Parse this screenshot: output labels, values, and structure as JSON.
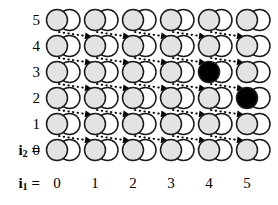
{
  "figure": {
    "title": "",
    "axis_x": {
      "label_prefix": "i",
      "label_sub": "1",
      "label_eq": " =",
      "ticks": [
        "0",
        "1",
        "2",
        "3",
        "4",
        "5"
      ]
    },
    "axis_y": {
      "label_prefix": "i",
      "label_sub": "2",
      "label_eq": " =",
      "ticks": [
        "5",
        "4",
        "3",
        "2",
        "1",
        "0"
      ]
    },
    "colors": {
      "shaded_circle": "#e3e3e3",
      "empty_circle": "#ffffff",
      "filled_circle": "#000000",
      "outline": "#1a1a1a",
      "arrow": "#000000"
    },
    "legend_note": ""
  },
  "chart_data": {
    "type": "scatter",
    "title": "",
    "xlabel": "i1",
    "ylabel": "i2",
    "x": [
      0,
      1,
      2,
      3,
      4,
      5
    ],
    "y": [
      0,
      1,
      2,
      3,
      4,
      5
    ],
    "xlim": [
      0,
      5
    ],
    "ylim": [
      0,
      5
    ],
    "grid": false,
    "legend_position": "none",
    "cell_glyph": "two-overlapping-circles",
    "cells": [
      {
        "i1": 0,
        "i2": 5,
        "left": "shaded",
        "right": "empty",
        "arrow_out": true
      },
      {
        "i1": 1,
        "i2": 5,
        "left": "shaded",
        "right": "empty",
        "arrow_out": true
      },
      {
        "i1": 2,
        "i2": 5,
        "left": "shaded",
        "right": "empty",
        "arrow_out": true
      },
      {
        "i1": 3,
        "i2": 5,
        "left": "shaded",
        "right": "empty",
        "arrow_out": true
      },
      {
        "i1": 4,
        "i2": 5,
        "left": "shaded",
        "right": "empty",
        "arrow_out": true
      },
      {
        "i1": 5,
        "i2": 5,
        "left": "shaded",
        "right": "empty",
        "arrow_out": false
      },
      {
        "i1": 0,
        "i2": 4,
        "left": "shaded",
        "right": "empty",
        "arrow_out": true
      },
      {
        "i1": 1,
        "i2": 4,
        "left": "shaded",
        "right": "empty",
        "arrow_out": true
      },
      {
        "i1": 2,
        "i2": 4,
        "left": "shaded",
        "right": "empty",
        "arrow_out": true
      },
      {
        "i1": 3,
        "i2": 4,
        "left": "shaded",
        "right": "empty",
        "arrow_out": true
      },
      {
        "i1": 4,
        "i2": 4,
        "left": "shaded",
        "right": "empty",
        "arrow_out": true
      },
      {
        "i1": 5,
        "i2": 4,
        "left": "shaded",
        "right": "empty",
        "arrow_out": false
      },
      {
        "i1": 0,
        "i2": 3,
        "left": "shaded",
        "right": "empty",
        "arrow_out": true
      },
      {
        "i1": 1,
        "i2": 3,
        "left": "shaded",
        "right": "empty",
        "arrow_out": true
      },
      {
        "i1": 2,
        "i2": 3,
        "left": "shaded",
        "right": "empty",
        "arrow_out": true
      },
      {
        "i1": 3,
        "i2": 3,
        "left": "shaded",
        "right": "empty",
        "arrow_out": true
      },
      {
        "i1": 4,
        "i2": 3,
        "left": "filled",
        "right": "empty",
        "arrow_out": true
      },
      {
        "i1": 5,
        "i2": 3,
        "left": "shaded",
        "right": "empty",
        "arrow_out": false
      },
      {
        "i1": 0,
        "i2": 2,
        "left": "shaded",
        "right": "empty",
        "arrow_out": true
      },
      {
        "i1": 1,
        "i2": 2,
        "left": "shaded",
        "right": "empty",
        "arrow_out": true
      },
      {
        "i1": 2,
        "i2": 2,
        "left": "shaded",
        "right": "empty",
        "arrow_out": true
      },
      {
        "i1": 3,
        "i2": 2,
        "left": "shaded",
        "right": "empty",
        "arrow_out": true
      },
      {
        "i1": 4,
        "i2": 2,
        "left": "shaded",
        "right": "empty",
        "arrow_out": true
      },
      {
        "i1": 5,
        "i2": 2,
        "left": "filled",
        "right": "empty",
        "arrow_out": false
      },
      {
        "i1": 0,
        "i2": 1,
        "left": "shaded",
        "right": "empty",
        "arrow_out": true
      },
      {
        "i1": 1,
        "i2": 1,
        "left": "shaded",
        "right": "empty",
        "arrow_out": true
      },
      {
        "i1": 2,
        "i2": 1,
        "left": "shaded",
        "right": "empty",
        "arrow_out": true
      },
      {
        "i1": 3,
        "i2": 1,
        "left": "shaded",
        "right": "empty",
        "arrow_out": true
      },
      {
        "i1": 4,
        "i2": 1,
        "left": "shaded",
        "right": "empty",
        "arrow_out": true
      },
      {
        "i1": 5,
        "i2": 1,
        "left": "shaded",
        "right": "empty",
        "arrow_out": false
      },
      {
        "i1": 0,
        "i2": 0,
        "left": "shaded",
        "right": "empty",
        "arrow_out": false
      },
      {
        "i1": 1,
        "i2": 0,
        "left": "shaded",
        "right": "empty",
        "arrow_out": false
      },
      {
        "i1": 2,
        "i2": 0,
        "left": "shaded",
        "right": "empty",
        "arrow_out": false
      },
      {
        "i1": 3,
        "i2": 0,
        "left": "shaded",
        "right": "empty",
        "arrow_out": false
      },
      {
        "i1": 4,
        "i2": 0,
        "left": "shaded",
        "right": "empty",
        "arrow_out": false
      },
      {
        "i1": 5,
        "i2": 0,
        "left": "shaded",
        "right": "empty",
        "arrow_out": false
      }
    ],
    "arrows": [
      {
        "from_i1": 0,
        "from_i2": 5,
        "to_i1": 1,
        "to_i2": 4
      },
      {
        "from_i1": 1,
        "from_i2": 5,
        "to_i1": 2,
        "to_i2": 4
      },
      {
        "from_i1": 2,
        "from_i2": 5,
        "to_i1": 3,
        "to_i2": 4
      },
      {
        "from_i1": 3,
        "from_i2": 5,
        "to_i1": 4,
        "to_i2": 4
      },
      {
        "from_i1": 4,
        "from_i2": 5,
        "to_i1": 5,
        "to_i2": 4
      },
      {
        "from_i1": 0,
        "from_i2": 4,
        "to_i1": 1,
        "to_i2": 3
      },
      {
        "from_i1": 1,
        "from_i2": 4,
        "to_i1": 2,
        "to_i2": 3
      },
      {
        "from_i1": 2,
        "from_i2": 4,
        "to_i1": 3,
        "to_i2": 3
      },
      {
        "from_i1": 3,
        "from_i2": 4,
        "to_i1": 4,
        "to_i2": 3
      },
      {
        "from_i1": 4,
        "from_i2": 4,
        "to_i1": 5,
        "to_i2": 3
      },
      {
        "from_i1": 0,
        "from_i2": 3,
        "to_i1": 1,
        "to_i2": 2
      },
      {
        "from_i1": 1,
        "from_i2": 3,
        "to_i1": 2,
        "to_i2": 2
      },
      {
        "from_i1": 2,
        "from_i2": 3,
        "to_i1": 3,
        "to_i2": 2
      },
      {
        "from_i1": 3,
        "from_i2": 3,
        "to_i1": 4,
        "to_i2": 2
      },
      {
        "from_i1": 4,
        "from_i2": 3,
        "to_i1": 5,
        "to_i2": 2
      },
      {
        "from_i1": 0,
        "from_i2": 2,
        "to_i1": 1,
        "to_i2": 1
      },
      {
        "from_i1": 1,
        "from_i2": 2,
        "to_i1": 2,
        "to_i2": 1
      },
      {
        "from_i1": 2,
        "from_i2": 2,
        "to_i1": 3,
        "to_i2": 1
      },
      {
        "from_i1": 3,
        "from_i2": 2,
        "to_i1": 4,
        "to_i2": 1
      },
      {
        "from_i1": 4,
        "from_i2": 2,
        "to_i1": 5,
        "to_i2": 1
      },
      {
        "from_i1": 0,
        "from_i2": 1,
        "to_i1": 1,
        "to_i2": 0
      },
      {
        "from_i1": 1,
        "from_i2": 1,
        "to_i1": 2,
        "to_i2": 0
      },
      {
        "from_i1": 2,
        "from_i2": 1,
        "to_i1": 3,
        "to_i2": 0
      },
      {
        "from_i1": 3,
        "from_i2": 1,
        "to_i1": 4,
        "to_i2": 0
      },
      {
        "from_i1": 4,
        "from_i2": 1,
        "to_i1": 5,
        "to_i2": 0
      }
    ]
  }
}
